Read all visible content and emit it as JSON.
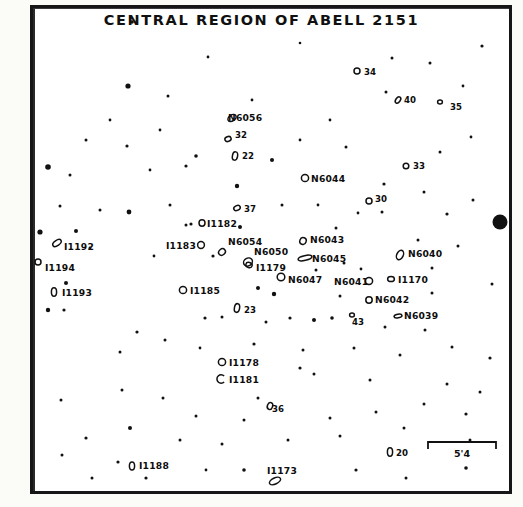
{
  "chart_data": {
    "type": "scatter",
    "title": "CENTRAL REGION OF ABELL 2151",
    "subtitle": "",
    "xlabel": "",
    "ylabel": "",
    "grid": false,
    "legend": "none",
    "scale_bar": {
      "label": "5'4",
      "description": "angular scale bar"
    },
    "labeled_objects": [
      {
        "label": "N6056",
        "x": 232,
        "y": 118,
        "lx": 228,
        "ly": 121,
        "marker": "ellipse",
        "rx": 4.5,
        "ry": 3.0,
        "rot": -35
      },
      {
        "label": "32",
        "x": 228,
        "y": 139,
        "lx": 235,
        "ly": 138,
        "marker": "ellipse",
        "rx": 3.2,
        "ry": 2.4,
        "rot": -20
      },
      {
        "label": "22",
        "x": 235,
        "y": 156,
        "lx": 242,
        "ly": 159,
        "marker": "ellipse",
        "rx": 2.6,
        "ry": 4.2,
        "rot": 10
      },
      {
        "label": "34",
        "x": 357,
        "y": 71,
        "lx": 364,
        "ly": 75,
        "marker": "circle",
        "rx": 3.0,
        "ry": 3.0,
        "rot": 0
      },
      {
        "label": "40",
        "x": 398,
        "y": 100,
        "lx": 404,
        "ly": 103,
        "marker": "ellipse",
        "rx": 2.2,
        "ry": 3.6,
        "rot": 35
      },
      {
        "label": "35",
        "x": 440,
        "y": 102,
        "lx": 450,
        "ly": 110,
        "marker": "ellipse",
        "rx": 2.4,
        "ry": 2.0,
        "rot": 0
      },
      {
        "label": "33",
        "x": 406,
        "y": 166,
        "lx": 413,
        "ly": 169,
        "marker": "circle",
        "rx": 2.8,
        "ry": 2.8,
        "rot": 0
      },
      {
        "label": "30",
        "x": 369,
        "y": 201,
        "lx": 375,
        "ly": 202,
        "marker": "circle",
        "rx": 3.0,
        "ry": 3.0,
        "rot": 0
      },
      {
        "label": "N6044",
        "x": 305,
        "y": 178,
        "lx": 311,
        "ly": 182,
        "marker": "circle",
        "rx": 3.6,
        "ry": 3.6,
        "rot": 0
      },
      {
        "label": "37",
        "x": 237,
        "y": 208,
        "lx": 244,
        "ly": 212,
        "marker": "ellipse",
        "rx": 3.4,
        "ry": 2.4,
        "rot": -25
      },
      {
        "label": "I1182",
        "x": 202,
        "y": 223,
        "lx": 207,
        "ly": 227,
        "marker": "ellipse",
        "rx": 3.0,
        "ry": 3.2,
        "rot": 0
      },
      {
        "label": "I1183",
        "x": 201,
        "y": 245,
        "lx": 166,
        "ly": 249,
        "marker": "circle",
        "rx": 3.4,
        "ry": 3.4,
        "rot": 0
      },
      {
        "label": "N6054",
        "x": 222,
        "y": 252,
        "lx": 228,
        "ly": 245,
        "marker": "ellipse",
        "rx": 3.6,
        "ry": 3.0,
        "rot": -40
      },
      {
        "label": "N6050",
        "x": 248,
        "y": 262,
        "lx": 254,
        "ly": 255,
        "marker": "ellipse",
        "rx": 4.6,
        "ry": 3.8,
        "rot": -30
      },
      {
        "label": "I1179",
        "x": 249,
        "y": 265,
        "lx": 256,
        "ly": 271,
        "marker": "ellipse",
        "rx": 3.2,
        "ry": 2.6,
        "rot": 15
      },
      {
        "label": "N6043",
        "x": 303,
        "y": 241,
        "lx": 310,
        "ly": 243,
        "marker": "ellipse",
        "rx": 3.2,
        "ry": 3.4,
        "rot": 20
      },
      {
        "label": "N6045",
        "x": 305,
        "y": 258,
        "lx": 312,
        "ly": 262,
        "marker": "ellipse",
        "rx": 7.0,
        "ry": 2.4,
        "rot": -12
      },
      {
        "label": "N6047",
        "x": 281,
        "y": 277,
        "lx": 288,
        "ly": 283,
        "marker": "circle",
        "rx": 3.8,
        "ry": 3.8,
        "rot": 0
      },
      {
        "label": "N6040",
        "x": 400,
        "y": 255,
        "lx": 408,
        "ly": 257,
        "marker": "ellipse",
        "rx": 3.2,
        "ry": 5.0,
        "rot": 25
      },
      {
        "label": "N6041",
        "x": 369,
        "y": 281,
        "lx": 334,
        "ly": 285,
        "marker": "ellipse",
        "rx": 3.6,
        "ry": 3.4,
        "rot": 0
      },
      {
        "label": "I1170",
        "x": 391,
        "y": 279,
        "lx": 398,
        "ly": 283,
        "marker": "ellipse",
        "rx": 3.4,
        "ry": 2.6,
        "rot": 0
      },
      {
        "label": "N6042",
        "x": 369,
        "y": 300,
        "lx": 375,
        "ly": 303,
        "marker": "circle",
        "rx": 3.2,
        "ry": 3.2,
        "rot": 0
      },
      {
        "label": "N6039",
        "x": 398,
        "y": 316,
        "lx": 404,
        "ly": 319,
        "marker": "ellipse",
        "rx": 4.0,
        "ry": 1.8,
        "rot": -10
      },
      {
        "label": "43",
        "x": 352,
        "y": 315,
        "lx": 352,
        "ly": 325,
        "marker": "ellipse",
        "rx": 2.4,
        "ry": 2.0,
        "rot": 0
      },
      {
        "label": "I1185",
        "x": 183,
        "y": 290,
        "lx": 190,
        "ly": 294,
        "marker": "circle",
        "rx": 3.6,
        "ry": 3.6,
        "rot": 0
      },
      {
        "label": "23",
        "x": 237,
        "y": 308,
        "lx": 244,
        "ly": 313,
        "marker": "ellipse",
        "rx": 2.6,
        "ry": 4.4,
        "rot": 10
      },
      {
        "label": "I1192",
        "x": 57,
        "y": 243,
        "lx": 64,
        "ly": 250,
        "marker": "ellipse",
        "rx": 4.8,
        "ry": 2.6,
        "rot": -35
      },
      {
        "label": "I1194",
        "x": 38,
        "y": 262,
        "lx": 45,
        "ly": 271,
        "marker": "circle",
        "rx": 3.0,
        "ry": 3.0,
        "rot": 0
      },
      {
        "label": "I1193",
        "x": 54,
        "y": 292,
        "lx": 62,
        "ly": 296,
        "marker": "ellipse",
        "rx": 2.6,
        "ry": 4.2,
        "rot": 0
      },
      {
        "label": "I1178",
        "x": 222,
        "y": 362,
        "lx": 229,
        "ly": 366,
        "marker": "circle",
        "rx": 3.6,
        "ry": 3.6,
        "rot": 0
      },
      {
        "label": "I1181",
        "x": 221,
        "y": 379,
        "lx": 229,
        "ly": 383,
        "marker": "arc",
        "rx": 4.2,
        "ry": 4.2,
        "rot": 0
      },
      {
        "label": "36",
        "x": 270,
        "y": 406,
        "lx": 272,
        "ly": 412,
        "marker": "ellipse",
        "rx": 2.6,
        "ry": 3.6,
        "rot": 20
      },
      {
        "label": "20",
        "x": 390,
        "y": 452,
        "lx": 396,
        "ly": 456,
        "marker": "ellipse",
        "rx": 2.6,
        "ry": 4.2,
        "rot": 0
      },
      {
        "label": "I1188",
        "x": 132,
        "y": 466,
        "lx": 139,
        "ly": 469,
        "marker": "ellipse",
        "rx": 2.6,
        "ry": 4.0,
        "rot": 0
      },
      {
        "label": "I1173",
        "x": 275,
        "y": 481,
        "lx": 267,
        "ly": 474,
        "marker": "ellipse",
        "rx": 6.0,
        "ry": 3.0,
        "rot": -25
      }
    ],
    "unlabeled_stars": [
      {
        "x": 132,
        "y": 22,
        "r": 1.8
      },
      {
        "x": 482,
        "y": 46,
        "r": 1.6
      },
      {
        "x": 392,
        "y": 58,
        "r": 1.5
      },
      {
        "x": 430,
        "y": 63,
        "r": 1.5
      },
      {
        "x": 208,
        "y": 57,
        "r": 1.4
      },
      {
        "x": 300,
        "y": 43,
        "r": 1.3
      },
      {
        "x": 128,
        "y": 86,
        "r": 2.6
      },
      {
        "x": 168,
        "y": 96,
        "r": 1.5
      },
      {
        "x": 386,
        "y": 92,
        "r": 1.5
      },
      {
        "x": 463,
        "y": 86,
        "r": 1.4
      },
      {
        "x": 196,
        "y": 156,
        "r": 1.8
      },
      {
        "x": 127,
        "y": 146,
        "r": 1.6
      },
      {
        "x": 186,
        "y": 166,
        "r": 1.6
      },
      {
        "x": 272,
        "y": 160,
        "r": 2.0
      },
      {
        "x": 48,
        "y": 167,
        "r": 2.8
      },
      {
        "x": 70,
        "y": 175,
        "r": 1.5
      },
      {
        "x": 346,
        "y": 147,
        "r": 1.5
      },
      {
        "x": 440,
        "y": 152,
        "r": 1.5
      },
      {
        "x": 471,
        "y": 137,
        "r": 1.4
      },
      {
        "x": 129,
        "y": 212,
        "r": 2.4
      },
      {
        "x": 170,
        "y": 205,
        "r": 1.5
      },
      {
        "x": 237,
        "y": 186,
        "r": 2.2
      },
      {
        "x": 282,
        "y": 205,
        "r": 1.5
      },
      {
        "x": 318,
        "y": 205,
        "r": 1.4
      },
      {
        "x": 384,
        "y": 184,
        "r": 1.6
      },
      {
        "x": 424,
        "y": 192,
        "r": 1.5
      },
      {
        "x": 358,
        "y": 213,
        "r": 1.4
      },
      {
        "x": 382,
        "y": 212,
        "r": 1.5
      },
      {
        "x": 447,
        "y": 214,
        "r": 1.6
      },
      {
        "x": 473,
        "y": 200,
        "r": 1.5
      },
      {
        "x": 191,
        "y": 224,
        "r": 1.6
      },
      {
        "x": 186,
        "y": 225,
        "r": 1.5
      },
      {
        "x": 240,
        "y": 227,
        "r": 2.0
      },
      {
        "x": 336,
        "y": 228,
        "r": 1.5
      },
      {
        "x": 40,
        "y": 232,
        "r": 2.6
      },
      {
        "x": 76,
        "y": 231,
        "r": 2.0
      },
      {
        "x": 213,
        "y": 256,
        "r": 1.6
      },
      {
        "x": 344,
        "y": 263,
        "r": 1.5
      },
      {
        "x": 361,
        "y": 269,
        "r": 1.4
      },
      {
        "x": 432,
        "y": 268,
        "r": 1.5
      },
      {
        "x": 316,
        "y": 270,
        "r": 1.5
      },
      {
        "x": 258,
        "y": 288,
        "r": 2.0
      },
      {
        "x": 274,
        "y": 294,
        "r": 2.2
      },
      {
        "x": 340,
        "y": 296,
        "r": 1.5
      },
      {
        "x": 432,
        "y": 293,
        "r": 1.5
      },
      {
        "x": 66,
        "y": 283,
        "r": 2.0
      },
      {
        "x": 48,
        "y": 310,
        "r": 2.2
      },
      {
        "x": 205,
        "y": 318,
        "r": 1.6
      },
      {
        "x": 222,
        "y": 317,
        "r": 1.5
      },
      {
        "x": 266,
        "y": 322,
        "r": 1.5
      },
      {
        "x": 290,
        "y": 318,
        "r": 1.6
      },
      {
        "x": 314,
        "y": 320,
        "r": 2.0
      },
      {
        "x": 332,
        "y": 318,
        "r": 1.8
      },
      {
        "x": 385,
        "y": 327,
        "r": 1.5
      },
      {
        "x": 425,
        "y": 330,
        "r": 1.5
      },
      {
        "x": 137,
        "y": 332,
        "r": 1.6
      },
      {
        "x": 165,
        "y": 340,
        "r": 1.5
      },
      {
        "x": 120,
        "y": 352,
        "r": 1.5
      },
      {
        "x": 200,
        "y": 348,
        "r": 1.4
      },
      {
        "x": 254,
        "y": 344,
        "r": 1.6
      },
      {
        "x": 303,
        "y": 350,
        "r": 1.5
      },
      {
        "x": 354,
        "y": 348,
        "r": 1.5
      },
      {
        "x": 400,
        "y": 355,
        "r": 1.5
      },
      {
        "x": 452,
        "y": 347,
        "r": 1.5
      },
      {
        "x": 490,
        "y": 358,
        "r": 1.6
      },
      {
        "x": 300,
        "y": 368,
        "r": 1.6
      },
      {
        "x": 314,
        "y": 374,
        "r": 1.5
      },
      {
        "x": 370,
        "y": 380,
        "r": 1.5
      },
      {
        "x": 447,
        "y": 384,
        "r": 1.5
      },
      {
        "x": 480,
        "y": 392,
        "r": 1.5
      },
      {
        "x": 122,
        "y": 390,
        "r": 1.5
      },
      {
        "x": 163,
        "y": 398,
        "r": 1.5
      },
      {
        "x": 258,
        "y": 398,
        "r": 1.5
      },
      {
        "x": 61,
        "y": 400,
        "r": 1.5
      },
      {
        "x": 196,
        "y": 416,
        "r": 1.5
      },
      {
        "x": 244,
        "y": 420,
        "r": 1.5
      },
      {
        "x": 330,
        "y": 418,
        "r": 1.5
      },
      {
        "x": 376,
        "y": 412,
        "r": 1.5
      },
      {
        "x": 424,
        "y": 404,
        "r": 1.5
      },
      {
        "x": 466,
        "y": 414,
        "r": 1.6
      },
      {
        "x": 130,
        "y": 428,
        "r": 2.0
      },
      {
        "x": 86,
        "y": 438,
        "r": 1.6
      },
      {
        "x": 180,
        "y": 440,
        "r": 1.5
      },
      {
        "x": 222,
        "y": 444,
        "r": 1.5
      },
      {
        "x": 288,
        "y": 440,
        "r": 1.5
      },
      {
        "x": 340,
        "y": 436,
        "r": 1.5
      },
      {
        "x": 404,
        "y": 428,
        "r": 1.5
      },
      {
        "x": 470,
        "y": 440,
        "r": 1.5
      },
      {
        "x": 118,
        "y": 462,
        "r": 1.6
      },
      {
        "x": 146,
        "y": 478,
        "r": 1.6
      },
      {
        "x": 244,
        "y": 470,
        "r": 1.8
      },
      {
        "x": 356,
        "y": 470,
        "r": 1.6
      },
      {
        "x": 406,
        "y": 478,
        "r": 1.5
      },
      {
        "x": 466,
        "y": 468,
        "r": 1.8
      },
      {
        "x": 62,
        "y": 455,
        "r": 1.5
      },
      {
        "x": 92,
        "y": 478,
        "r": 1.5
      },
      {
        "x": 206,
        "y": 470,
        "r": 1.4
      },
      {
        "x": 154,
        "y": 256,
        "r": 1.4
      },
      {
        "x": 90,
        "y": 248,
        "r": 1.4
      },
      {
        "x": 64,
        "y": 310,
        "r": 1.6
      },
      {
        "x": 100,
        "y": 210,
        "r": 1.5
      },
      {
        "x": 86,
        "y": 140,
        "r": 1.5
      },
      {
        "x": 110,
        "y": 120,
        "r": 1.4
      },
      {
        "x": 160,
        "y": 130,
        "r": 1.4
      },
      {
        "x": 252,
        "y": 100,
        "r": 1.4
      },
      {
        "x": 330,
        "y": 120,
        "r": 1.4
      },
      {
        "x": 418,
        "y": 240,
        "r": 1.5
      },
      {
        "x": 458,
        "y": 246,
        "r": 1.5
      },
      {
        "x": 492,
        "y": 284,
        "r": 1.5
      },
      {
        "x": 60,
        "y": 206,
        "r": 1.5
      },
      {
        "x": 150,
        "y": 170,
        "r": 1.4
      },
      {
        "x": 300,
        "y": 140,
        "r": 1.4
      }
    ],
    "bright_star": {
      "x": 500,
      "y": 222,
      "r": 7.5,
      "note": "bright foreground star"
    }
  }
}
